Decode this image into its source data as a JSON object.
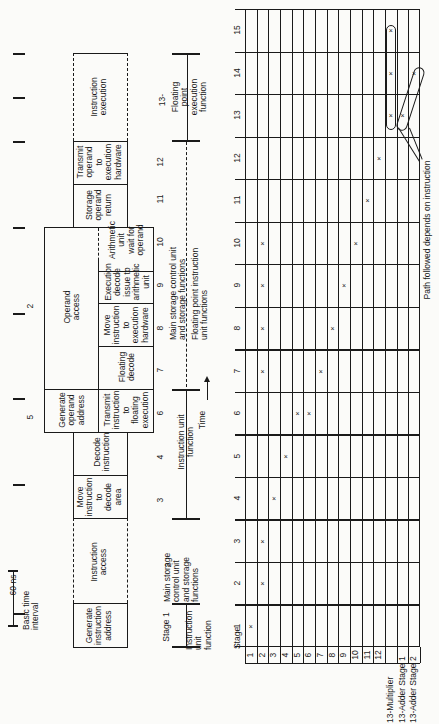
{
  "figure": {
    "time_scale": {
      "label": "60 ns",
      "caption": "Basic time\ninterval"
    },
    "interval_numbers": [
      "2",
      "5"
    ],
    "pipeline_boxes": [
      {
        "id": "generate-instruction-address",
        "text": "Generate\ninstruction\naddress",
        "stage": "1"
      },
      {
        "id": "instruction-access",
        "text": "Instruction\naccess",
        "stage": "2"
      },
      {
        "id": "move-instruction-decode",
        "text": "Move\ninstruction\nto\ndecode\narea",
        "stage": "3"
      },
      {
        "id": "decode-instruction",
        "text": "Decode\ninstruction",
        "stage": "4"
      },
      {
        "id": "generate-operand-address",
        "text": "Generate\noperand\naddress",
        "stage": "5"
      },
      {
        "id": "transmit-instruction-floating",
        "text": "Transmit\ninstruction\nto\nfloating\nexecution",
        "stage": "6"
      },
      {
        "id": "operand-access",
        "text": "Operand\naccess",
        "stage": "7-10"
      },
      {
        "id": "floating-decode",
        "text": "Floating\ndecode",
        "stage": "7"
      },
      {
        "id": "move-instruction-execution",
        "text": "Move\ninstruction\nto\nexecution\nhardware",
        "stage": "8"
      },
      {
        "id": "execution-decode",
        "text": "Execution\ndecode\nissue to\narithmetic\nunit",
        "stage": "9"
      },
      {
        "id": "arithmetic-wait",
        "text": "Arithmetic\nunit\nwait for\noperand",
        "stage": "10"
      },
      {
        "id": "storage-operand-return",
        "text": "Storage\noperand\nreturn",
        "stage": "11"
      },
      {
        "id": "transmit-operand",
        "text": "Transmit\noperand\nto\nexecution\nhardware",
        "stage": "12"
      },
      {
        "id": "instruction-execution",
        "text": "Instruction\nexecution",
        "stage": "13-15"
      }
    ],
    "stage_numbers": [
      "Stage 1",
      "2",
      "3",
      "4",
      "6",
      "7",
      "8",
      "9",
      "10",
      "11",
      "12",
      "13-"
    ],
    "function_labels": {
      "instruction_unit_1": "Instruction\nunit\nfunction",
      "main_storage_2": "Main storage\ncontrol unit\nand storage\nfunctions",
      "instruction_unit_3_6": "Instruction unit\nfunction",
      "main_storage_8_10": "Main storage control unit\nand storage functions",
      "floating_point_instruction": "Floating point instruction\nunit functions",
      "floating_point_execution": "Floating\npoint\nexecution\nfunction"
    },
    "time_axis_label": "Time",
    "annotation": "Path followed depends on instruction"
  },
  "chart_data": {
    "type": "table",
    "xlabel": "Time",
    "ylabel": "Stage",
    "time_intervals": [
      "1",
      "2",
      "3",
      "4",
      "5",
      "6",
      "7",
      "8",
      "9",
      "10",
      "11",
      "12",
      "13",
      "14",
      "15"
    ],
    "stages": [
      "1",
      "2",
      "3",
      "4",
      "5",
      "6",
      "7",
      "8",
      "9",
      "10",
      "11",
      "12",
      "13-Multiplier",
      "13-Adder Stage 1",
      "13-Adder Stage 2"
    ],
    "occupancy": [
      {
        "time": "1",
        "stages": [
          "1"
        ]
      },
      {
        "time": "2",
        "stages": [
          "2"
        ]
      },
      {
        "time": "3",
        "stages": [
          "2"
        ]
      },
      {
        "time": "4",
        "stages": [
          "3"
        ]
      },
      {
        "time": "5",
        "stages": [
          "4"
        ]
      },
      {
        "time": "6",
        "stages": [
          "5",
          "6"
        ]
      },
      {
        "time": "7",
        "stages": [
          "2",
          "7"
        ]
      },
      {
        "time": "8",
        "stages": [
          "2",
          "8"
        ]
      },
      {
        "time": "9",
        "stages": [
          "2",
          "9"
        ]
      },
      {
        "time": "10",
        "stages": [
          "2",
          "10"
        ]
      },
      {
        "time": "11",
        "stages": [
          "11"
        ]
      },
      {
        "time": "12",
        "stages": [
          "12"
        ]
      },
      {
        "time": "13",
        "stages": [
          "13-Multiplier",
          "13-Adder Stage 1"
        ]
      },
      {
        "time": "14",
        "stages": [
          "13-Multiplier",
          "13-Adder Stage 2"
        ]
      },
      {
        "time": "15",
        "stages": [
          "13-Multiplier"
        ]
      }
    ],
    "mark_symbol": "×",
    "paths": [
      {
        "name": "multiplier path",
        "cells": [
          [
            "13-Multiplier",
            "13"
          ],
          [
            "13-Multiplier",
            "14"
          ],
          [
            "13-Multiplier",
            "15"
          ]
        ]
      },
      {
        "name": "adder path",
        "cells": [
          [
            "13-Adder Stage 1",
            "13"
          ],
          [
            "13-Adder Stage 2",
            "14"
          ]
        ]
      }
    ],
    "stage_header": "Stage"
  }
}
